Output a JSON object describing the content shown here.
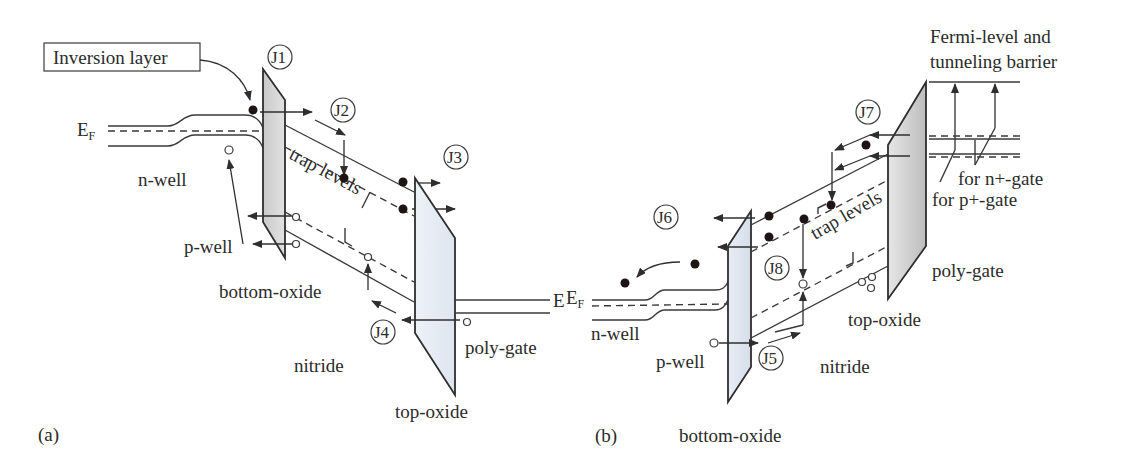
{
  "figure": {
    "panel_a": {
      "label": "(a)",
      "callout_box": "Inversion layer",
      "fermi_label": "E",
      "fermi_sub": "F",
      "regions": {
        "n_well": "n-well",
        "p_well": "p-well",
        "bottom_oxide": "bottom-oxide",
        "nitride": "nitride",
        "top_oxide": "top-oxide",
        "poly_gate": "poly-gate",
        "gate_fermi": "E"
      },
      "trap_label": "trap levels",
      "currents": [
        "J1",
        "J2",
        "J3",
        "J4"
      ]
    },
    "panel_b": {
      "label": "(b)",
      "fermi_label": "E",
      "fermi_sub": "F",
      "regions": {
        "n_well": "n-well",
        "p_well": "p-well",
        "bottom_oxide": "bottom-oxide",
        "nitride": "nitride",
        "top_oxide": "top-oxide",
        "poly_gate": "poly-gate"
      },
      "trap_label": "trap levels",
      "currents": [
        "J5",
        "J6",
        "J7",
        "J8"
      ],
      "annotation_line1": "Fermi-level and",
      "annotation_line2": "tunneling barrier",
      "n_gate_label": "for n+-gate",
      "p_gate_label": "for p+-gate"
    },
    "colors": {
      "line": "#3a3a3a",
      "oxide_fill_a1": "#d4d4d4",
      "oxide_fill_a2": "#e6ecf4",
      "oxide_fill_b1": "#e2e8f2",
      "oxide_fill_b2": "#cfcfcf"
    }
  }
}
